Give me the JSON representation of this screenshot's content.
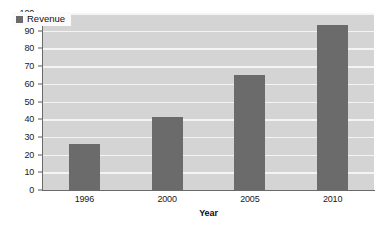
{
  "chart_data": {
    "type": "bar",
    "title": "",
    "subtitle": "",
    "categories": [
      "1996",
      "2000",
      "2005",
      "2010"
    ],
    "series": [
      {
        "name": "Revenue",
        "values": [
          26,
          41,
          65,
          93
        ],
        "color": "#6b6b6b"
      }
    ],
    "xlabel": "Year",
    "ylabel": "",
    "ylim": [
      0,
      100
    ],
    "y_ticks": [
      0,
      10,
      20,
      30,
      40,
      50,
      60,
      70,
      80,
      90,
      100
    ],
    "y_tick_labels": [
      "0",
      "10",
      "20",
      "30",
      "40",
      "50",
      "60",
      "70",
      "80",
      "90",
      "100"
    ],
    "grid": true,
    "grid_axis": "y",
    "grid_color": "#f4f4f4",
    "plot_background": "#d4d4d4",
    "figure_background": "#ffffff",
    "legend_position": "upper left",
    "legend_entries": [
      "Revenue"
    ],
    "annotations": []
  },
  "legend": {
    "items": [
      {
        "label": "Revenue",
        "swatch_color": "#6b6b6b"
      }
    ]
  },
  "axes": {
    "x_title": "Year",
    "y_title": ""
  }
}
